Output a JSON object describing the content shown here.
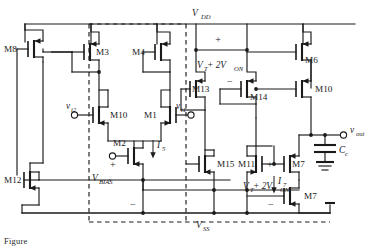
{
  "figure": {
    "type": "circuit-schematic",
    "caption": "Figure"
  },
  "rails": {
    "vdd": "V",
    "vdd_sub": "DD",
    "vss": "V",
    "vss_sub": "SS"
  },
  "devices": [
    {
      "id": "M8",
      "label": "M8",
      "type": "pmos"
    },
    {
      "id": "M3",
      "label": "M3",
      "type": "pmos"
    },
    {
      "id": "M4",
      "label": "M4",
      "type": "pmos"
    },
    {
      "id": "M6",
      "label": "M6",
      "type": "pmos"
    },
    {
      "id": "M13",
      "label": "M13",
      "type": "pmos"
    },
    {
      "id": "M14",
      "label": "M14",
      "type": "pmos"
    },
    {
      "id": "M10",
      "label": "M10",
      "type": "pmos"
    },
    {
      "id": "M1",
      "label": "M1",
      "type": "nmos"
    },
    {
      "id": "M2",
      "label": "M2",
      "type": "nmos"
    },
    {
      "id": "M5",
      "label": "M5",
      "type": "nmos"
    },
    {
      "id": "M9",
      "label": "M9",
      "type": "nmos"
    },
    {
      "id": "M12",
      "label": "M12",
      "type": "nmos"
    },
    {
      "id": "M15",
      "label": "M15",
      "type": "nmos"
    },
    {
      "id": "M11",
      "label": "M11",
      "type": "nmos"
    },
    {
      "id": "M7",
      "label": "M7",
      "type": "nmos"
    }
  ],
  "nodes": {
    "vin_minus": "v",
    "vin_minus_sub": "i2",
    "vin_plus": "v",
    "vin_plus_sub": "i1",
    "vout": "v",
    "vout_sub": "out",
    "vbias": "V",
    "vbias_sub": "BIAS",
    "cc": "C",
    "cc_sub": "c"
  },
  "currents": [
    {
      "id": "I5",
      "label": "I",
      "sub": "5"
    },
    {
      "id": "I7",
      "label": "I",
      "sub": "7"
    }
  ],
  "voltage_labels": [
    {
      "id": "vt-top",
      "text": "V",
      "sub": "T",
      "mid": " + 2V",
      "sub2": "ON",
      "plus": "+",
      "minus": "−"
    },
    {
      "id": "vt-middle",
      "text": "V",
      "sub": "T",
      "mid": " + 2V",
      "sub2": "ON",
      "plus": "+",
      "minus": "−"
    },
    {
      "id": "vt-bottom",
      "text": "V",
      "sub": "T",
      "mid": " + 2V",
      "sub2": "ON",
      "plus": "+",
      "minus": "−"
    }
  ],
  "colors": {
    "ink": "#1a1a1a",
    "background": "#ffffff"
  }
}
